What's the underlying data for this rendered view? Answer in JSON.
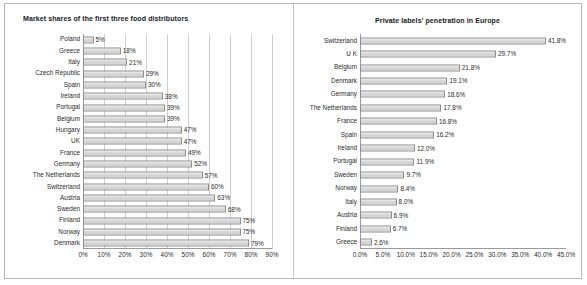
{
  "chart_data": [
    {
      "type": "bar",
      "orientation": "horizontal",
      "title": "Market shares of the first three food distributors",
      "xlabel": "",
      "ylabel": "",
      "xlim": [
        0,
        90
      ],
      "xticks": [
        "0%",
        "10%",
        "20%",
        "30%",
        "40%",
        "50%",
        "60%",
        "70%",
        "80%",
        "90%"
      ],
      "xtick_values": [
        0,
        10,
        20,
        30,
        40,
        50,
        60,
        70,
        80,
        90
      ],
      "grid": true,
      "legend": "none",
      "categories": [
        "Poland",
        "Greece",
        "Italy",
        "Czech Republic",
        "Spain",
        "Ireland",
        "Portugal",
        "Belgium",
        "Hungary",
        "UK",
        "France",
        "Germany",
        "The Netherlands",
        "Switzerland",
        "Austria",
        "Sweden",
        "Finland",
        "Norway",
        "Denmark"
      ],
      "values": [
        5,
        18,
        21,
        29,
        30,
        38,
        39,
        39,
        47,
        47,
        49,
        52,
        57,
        60,
        63,
        68,
        75,
        75,
        79
      ],
      "data_labels": [
        "5%",
        "18%",
        "21%",
        "29%",
        "30%",
        "38%",
        "39%",
        "39%",
        "47%",
        "47%",
        "49%",
        "52%",
        "57%",
        "60%",
        "63%",
        "68%",
        "75%",
        "75%",
        "79%"
      ]
    },
    {
      "type": "bar",
      "orientation": "horizontal",
      "title": "Private labels' penetration in Europe",
      "xlabel": "",
      "ylabel": "",
      "xlim": [
        0,
        45
      ],
      "xticks": [
        "0.0%",
        "5.0%",
        "10.0%",
        "15.0%",
        "20.0%",
        "25.0%",
        "30.0%",
        "35.0%",
        "40.0%",
        "45.0%"
      ],
      "xtick_values": [
        0,
        5,
        10,
        15,
        20,
        25,
        30,
        35,
        40,
        45
      ],
      "grid": false,
      "legend": "none",
      "categories": [
        "Switzerland",
        "U K",
        "Belgium",
        "Denmark",
        "Germany",
        "The Netherlands",
        "France",
        "Spain",
        "Ireland",
        "Portugal",
        "Sweden",
        "Norway",
        "Italy",
        "Austria",
        "Finland",
        "Greece"
      ],
      "values": [
        41.8,
        29.7,
        21.8,
        19.1,
        18.6,
        17.8,
        16.8,
        16.2,
        12.0,
        11.9,
        9.7,
        8.4,
        8.0,
        6.9,
        6.7,
        2.6
      ],
      "data_labels": [
        "41.8%",
        "29.7%",
        "21.8%",
        "19.1%",
        "18.6%",
        "17.8%",
        "16.8%",
        "16.2%",
        "12.0%",
        "11.9%",
        "9.7%",
        "8.4%",
        "8.0%",
        "6.9%",
        "6.7%",
        "2.6%"
      ]
    }
  ],
  "colors": {
    "bar_fill": "#dcdcdc",
    "bar_border": "#8d8d8d",
    "gridline": "#d0d0d0",
    "axis": "#9a9a9a",
    "text": "#2b2b2b",
    "frame": "#b9b9b9"
  }
}
